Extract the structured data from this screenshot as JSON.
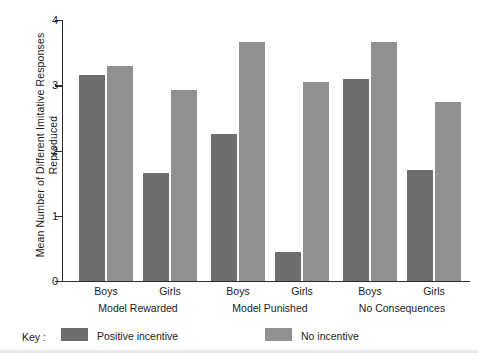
{
  "chart_data": {
    "type": "bar",
    "title": "",
    "xlabel": "",
    "ylabel": "Mean Number of Different Imitative Responses Reproduced",
    "ylabel_line1": "Mean Number of Different Imitative Responses",
    "ylabel_line2": "Reproduced",
    "ylim": [
      0,
      4
    ],
    "yticks": [
      "0",
      "1",
      "2",
      "3",
      "4"
    ],
    "ytick_values": [
      0,
      1,
      2,
      3,
      4
    ],
    "grid": false,
    "legend_position": "bottom-left",
    "legend_title": "Key :",
    "groups": [
      "Model Rewarded",
      "Model Punished",
      "No Consequences"
    ],
    "categories": [
      "Boys (Model Rewarded)",
      "Girls (Model Rewarded)",
      "Boys (Model Punished)",
      "Girls (Model Punished)",
      "Boys (No Consequences)",
      "Girls (No Consequences)"
    ],
    "subcategories": [
      "Boys",
      "Girls",
      "Boys",
      "Girls",
      "Boys",
      "Girls"
    ],
    "series": [
      {
        "name": "Positive incentive",
        "color": "#6e6e6e",
        "values": [
          3.15,
          1.65,
          2.25,
          0.45,
          3.1,
          1.7
        ]
      },
      {
        "name": "No incentive",
        "color": "#919191",
        "values": [
          3.3,
          2.92,
          3.67,
          3.05,
          3.67,
          2.75
        ]
      }
    ]
  },
  "axis": {
    "line_color": "#2b2b2b"
  }
}
